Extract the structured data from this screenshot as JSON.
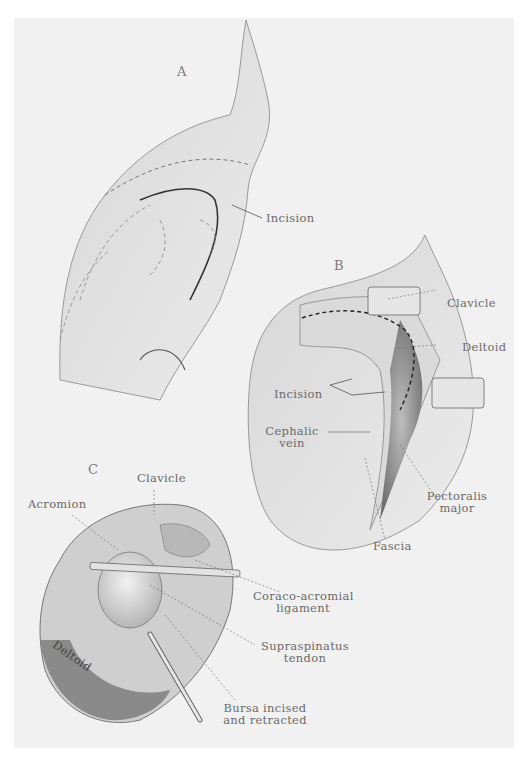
{
  "figure": {
    "panels": [
      {
        "letter": "A",
        "labels": [
          "Incision"
        ]
      },
      {
        "letter": "B",
        "labels": [
          "Clavicle",
          "Deltoid",
          "Incision",
          "Cephalic vein",
          "Pectoralis major",
          "Fascia"
        ]
      },
      {
        "letter": "C",
        "labels": [
          "Clavicle",
          "Acromion",
          "Coraco-acromial ligament",
          "Supraspinatus tendon",
          "Bursa incised and retracted",
          "Deltoid"
        ]
      }
    ]
  },
  "panelA": {
    "letter": "A",
    "incision": "Incision"
  },
  "panelB": {
    "letter": "B",
    "clavicle": "Clavicle",
    "deltoid": "Deltoid",
    "incision": "Incision",
    "cephalic_1": "Cephalic",
    "cephalic_2": "vein",
    "pectoralis_1": "Pectoralis",
    "pectoralis_2": "major",
    "fascia": "Fascia"
  },
  "panelC": {
    "letter": "C",
    "clavicle": "Clavicle",
    "acromion": "Acromion",
    "coraco_1": "Coraco-acromial",
    "coraco_2": "ligament",
    "supra_1": "Supraspinatus",
    "supra_2": "tendon",
    "bursa_1": "Bursa incised",
    "bursa_2": "and retracted",
    "deltoid_muscle": "Deltoid"
  }
}
